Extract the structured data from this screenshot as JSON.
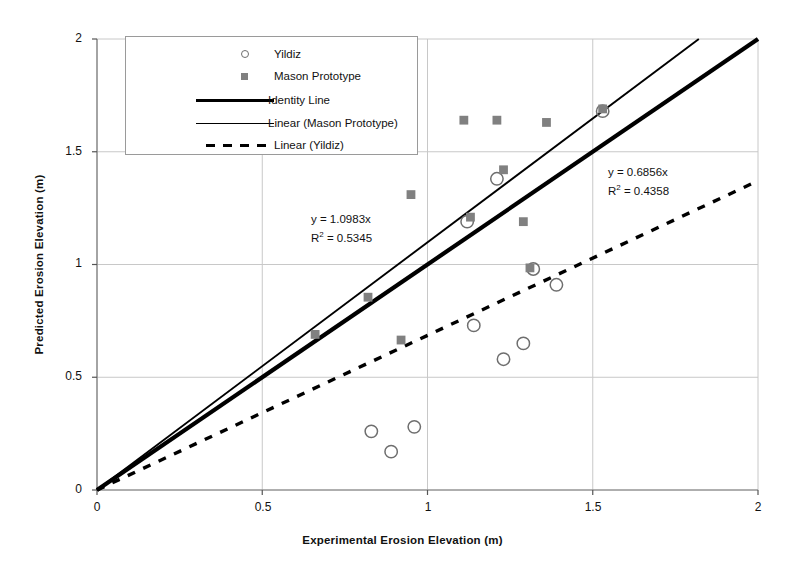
{
  "chart_data": {
    "type": "scatter",
    "title": "",
    "xlabel": "Experimental Erosion Elevation (m)",
    "ylabel": "Predicted Erosion Elevation (m)",
    "xlim": [
      0,
      2
    ],
    "ylim": [
      0,
      2
    ],
    "xticks": [
      "0",
      "0.5",
      "1",
      "1.5",
      "2"
    ],
    "yticks": [
      "0",
      "0.5",
      "1",
      "1.5",
      "2"
    ],
    "grid": true,
    "legend_position": "top-left",
    "series": [
      {
        "name": "Yildiz",
        "marker": "open-circle",
        "color": "#6e6e6e",
        "points": [
          [
            1.12,
            1.19
          ],
          [
            1.21,
            1.38
          ],
          [
            1.53,
            1.68
          ],
          [
            1.32,
            0.98
          ],
          [
            1.39,
            0.91
          ],
          [
            1.23,
            0.58
          ],
          [
            1.29,
            0.65
          ],
          [
            1.14,
            0.73
          ],
          [
            0.83,
            0.26
          ],
          [
            0.89,
            0.17
          ],
          [
            0.96,
            0.28
          ]
        ]
      },
      {
        "name": "Mason Prototype",
        "marker": "filled-square",
        "color": "#808080",
        "points": [
          [
            1.11,
            1.64
          ],
          [
            1.21,
            1.64
          ],
          [
            1.36,
            1.63
          ],
          [
            1.53,
            1.69
          ],
          [
            1.23,
            1.42
          ],
          [
            1.13,
            1.21
          ],
          [
            0.95,
            1.31
          ],
          [
            1.29,
            1.19
          ],
          [
            0.82,
            0.855
          ],
          [
            0.66,
            0.69
          ],
          [
            0.92,
            0.665
          ],
          [
            1.31,
            0.985
          ]
        ]
      }
    ],
    "lines": [
      {
        "name": "Identity Line",
        "style": "thick-solid",
        "slope": 1.0,
        "intercept": 0,
        "color": "#000000"
      },
      {
        "name": "Linear (Mason Prototype)",
        "style": "thin-solid",
        "slope": 1.0983,
        "intercept": 0,
        "color": "#000000"
      },
      {
        "name": "Linear (Yildiz)",
        "style": "dashed",
        "slope": 0.6856,
        "intercept": 0,
        "color": "#000000"
      }
    ],
    "annotations": [
      {
        "id": "mason-fit",
        "equation": "y = 1.0983x",
        "r2_label": "R",
        "r2_sup": "2",
        "r2_value": " = 0.5345"
      },
      {
        "id": "yildiz-fit",
        "equation": "y = 0.6856x",
        "r2_label": "R",
        "r2_sup": "2",
        "r2_value": " = 0.4358"
      }
    ]
  },
  "legend": {
    "entries": [
      {
        "label": "Yildiz",
        "marker": "open-circle"
      },
      {
        "label": "Mason Prototype",
        "marker": "filled-square"
      },
      {
        "label": "Identity Line",
        "marker": "thick-line"
      },
      {
        "label": "Linear (Mason Prototype)",
        "marker": "thin-line"
      },
      {
        "label": "Linear (Yildiz)",
        "marker": "dashed-line"
      }
    ]
  }
}
